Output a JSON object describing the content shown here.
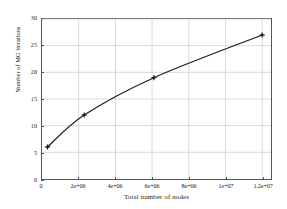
{
  "chart_data": {
    "type": "line",
    "title": "",
    "xlabel": "Total number of nodes",
    "ylabel": "Number of MG iterations",
    "x": [
      300000,
      2300000,
      6100000,
      12000000
    ],
    "values": [
      6,
      12,
      19,
      27
    ],
    "series": [
      {
        "name": "Number of MG iterations",
        "x": [
          300000,
          2300000,
          6100000,
          12000000
        ],
        "values": [
          6,
          12,
          19,
          27
        ],
        "marker": "plus",
        "color": "#1a1a1a"
      }
    ],
    "xlim": [
      0,
      12480000
    ],
    "ylim": [
      0,
      30
    ],
    "xticks": [
      0,
      2000000,
      4000000,
      6000000,
      8000000,
      10000000,
      12000000
    ],
    "xtick_labels": [
      "0",
      "2e+06",
      "4e+06",
      "6e+06",
      "8e+06",
      "1e+07",
      "1.2e+07"
    ],
    "yticks": [
      0,
      5,
      10,
      15,
      20,
      25,
      30
    ],
    "ytick_labels": [
      "0",
      "5",
      "10",
      "15",
      "20",
      "25",
      "30"
    ],
    "grid": true,
    "grid_color": "#c9c9c9",
    "legend": null,
    "legend_position": "none",
    "frame_color": "#55555a",
    "background": "#ffffff"
  },
  "figure": {
    "background": "#ffffff",
    "line_color": "#1a1a1a",
    "marker_color": "#1a1a1a"
  }
}
